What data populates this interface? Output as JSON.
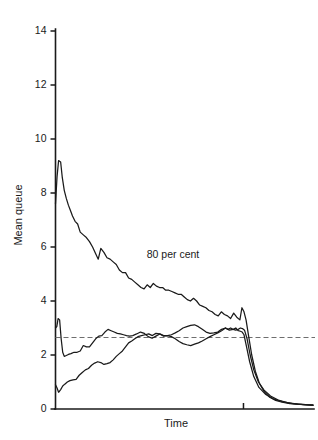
{
  "chart_data": {
    "type": "line",
    "title": "",
    "xlabel": "Time",
    "ylabel": "Mean queue",
    "ylim": [
      0,
      14
    ],
    "yticks": [
      0,
      2,
      4,
      6,
      8,
      10,
      12,
      14
    ],
    "ytick_labels": [
      "0",
      "2",
      "4",
      "6",
      "8",
      "10",
      "12",
      "14"
    ],
    "xlim": [
      0,
      100
    ],
    "xticks": [
      73
    ],
    "xtick_labels": [
      ""
    ],
    "grid": false,
    "legend": "none",
    "annotations": [
      {
        "text": "80 per cent",
        "x": 35,
        "y": 5.7
      }
    ],
    "reference_lines": [
      {
        "orientation": "horizontal",
        "value": 2.65,
        "style": "dashed",
        "color": "#6e6e6e"
      }
    ],
    "series": [
      {
        "name": "80 per cent",
        "color": "#1a1a1a",
        "x": [
          0.0,
          0.6,
          1.2,
          2.0,
          2.6,
          3.4,
          4.2,
          5.0,
          5.8,
          6.6,
          7.6,
          8.6,
          9.6,
          10.8,
          12.0,
          13.2,
          14.4,
          15.6,
          16.6,
          17.6,
          18.8,
          20.0,
          21.2,
          22.4,
          23.6,
          24.8,
          26.0,
          27.2,
          28.4,
          29.6,
          30.8,
          32.0,
          33.2,
          34.4,
          35.6,
          36.8,
          38.0,
          39.2,
          40.4,
          41.6,
          42.8,
          44.0,
          45.2,
          46.4,
          47.6,
          48.8,
          50.0,
          51.2,
          52.4,
          53.6,
          54.8,
          56.0,
          57.2,
          58.4,
          59.6,
          60.8,
          62.0,
          63.2,
          64.4,
          65.6,
          66.8,
          68.0,
          69.2,
          70.4,
          71.6,
          72.4,
          73.2,
          74.0,
          75.0,
          76.2,
          77.6,
          79.2,
          81.0,
          83.0,
          85.5,
          88.0,
          91.0,
          94.0,
          97.0,
          100.0
        ],
        "y": [
          7.6,
          8.6,
          9.2,
          9.15,
          8.6,
          8.1,
          7.8,
          7.55,
          7.35,
          7.15,
          6.95,
          6.85,
          6.55,
          6.45,
          6.35,
          6.2,
          6.0,
          5.75,
          5.55,
          5.95,
          5.8,
          5.6,
          5.55,
          5.45,
          5.35,
          5.15,
          5.05,
          5.05,
          4.85,
          4.8,
          4.7,
          4.6,
          4.5,
          4.45,
          4.6,
          4.5,
          4.65,
          4.55,
          4.5,
          4.5,
          4.4,
          4.4,
          4.35,
          4.3,
          4.25,
          4.25,
          4.15,
          4.05,
          4.0,
          4.1,
          4.0,
          3.85,
          3.8,
          3.75,
          3.65,
          3.6,
          3.5,
          3.45,
          3.6,
          3.5,
          3.45,
          3.35,
          3.55,
          3.4,
          3.3,
          3.75,
          3.6,
          3.3,
          2.7,
          2.0,
          1.4,
          0.95,
          0.65,
          0.45,
          0.32,
          0.25,
          0.2,
          0.18,
          0.16,
          0.15
        ]
      },
      {
        "name": "middle curve",
        "color": "#1a1a1a",
        "x": [
          0.0,
          0.5,
          1.0,
          1.6,
          2.2,
          2.8,
          3.4,
          4.2,
          5.0,
          6.0,
          7.2,
          8.4,
          9.6,
          10.8,
          12.0,
          13.2,
          14.4,
          15.6,
          16.8,
          18.0,
          19.2,
          20.4,
          21.6,
          22.8,
          24.0,
          25.2,
          26.4,
          27.6,
          28.8,
          30.0,
          31.5,
          33.0,
          34.5,
          36.0,
          37.5,
          39.0,
          40.5,
          42.0,
          43.5,
          45.0,
          46.5,
          48.0,
          49.5,
          51.0,
          52.5,
          54.0,
          55.5,
          57.0,
          58.5,
          60.0,
          61.5,
          63.0,
          64.5,
          66.0,
          67.0,
          68.0,
          69.0,
          70.0,
          71.0,
          71.8,
          72.6,
          73.4,
          74.4,
          75.6,
          77.0,
          78.8,
          81.0,
          83.5,
          86.5,
          90.0,
          94.0,
          100.0
        ],
        "y": [
          3.0,
          3.05,
          3.35,
          3.3,
          2.6,
          2.1,
          1.95,
          1.98,
          2.02,
          2.05,
          2.1,
          2.1,
          2.15,
          2.35,
          2.3,
          2.3,
          2.45,
          2.6,
          2.7,
          2.72,
          2.85,
          2.95,
          2.9,
          2.85,
          2.8,
          2.78,
          2.75,
          2.72,
          2.7,
          2.72,
          2.78,
          2.85,
          2.8,
          2.68,
          2.62,
          2.7,
          2.78,
          2.72,
          2.72,
          2.75,
          2.82,
          2.9,
          3.0,
          3.05,
          3.1,
          3.12,
          3.05,
          2.95,
          2.85,
          2.8,
          2.82,
          2.85,
          2.95,
          3.0,
          2.95,
          3.0,
          2.95,
          2.92,
          2.95,
          3.0,
          2.98,
          2.92,
          2.6,
          2.0,
          1.45,
          1.0,
          0.7,
          0.48,
          0.33,
          0.24,
          0.18,
          0.14
        ]
      },
      {
        "name": "lower curve",
        "color": "#1a1a1a",
        "x": [
          0.0,
          0.6,
          1.2,
          2.0,
          2.8,
          3.6,
          4.6,
          5.6,
          6.8,
          8.0,
          9.2,
          10.4,
          11.6,
          12.8,
          14.0,
          15.2,
          16.4,
          17.6,
          18.8,
          20.0,
          21.2,
          22.4,
          23.6,
          24.8,
          26.0,
          27.2,
          28.4,
          29.6,
          30.8,
          32.0,
          33.4,
          34.8,
          36.2,
          37.6,
          39.0,
          40.5,
          42.0,
          43.5,
          45.0,
          46.5,
          48.0,
          49.5,
          51.0,
          52.5,
          54.0,
          55.5,
          57.0,
          58.5,
          60.0,
          61.5,
          63.0,
          64.5,
          66.0,
          67.5,
          69.0,
          70.0,
          71.0,
          71.8,
          72.5,
          73.2,
          74.2,
          75.4,
          77.0,
          79.0,
          81.5,
          84.5,
          88.0,
          92.0,
          96.0,
          100.0
        ],
        "y": [
          0.9,
          0.78,
          0.62,
          0.72,
          0.85,
          0.92,
          1.0,
          1.05,
          1.08,
          1.1,
          1.25,
          1.35,
          1.45,
          1.5,
          1.62,
          1.7,
          1.75,
          1.72,
          1.65,
          1.68,
          1.72,
          1.82,
          1.95,
          2.05,
          2.15,
          2.3,
          2.45,
          2.52,
          2.6,
          2.68,
          2.72,
          2.75,
          2.78,
          2.72,
          2.8,
          2.78,
          2.7,
          2.72,
          2.68,
          2.6,
          2.5,
          2.42,
          2.38,
          2.35,
          2.4,
          2.45,
          2.52,
          2.6,
          2.68,
          2.75,
          2.82,
          2.9,
          3.0,
          2.92,
          2.95,
          3.0,
          2.9,
          2.88,
          2.85,
          2.75,
          2.3,
          1.75,
          1.2,
          0.8,
          0.55,
          0.38,
          0.27,
          0.2,
          0.16,
          0.13
        ]
      }
    ]
  },
  "labels": {
    "y_axis_title": "Mean queue",
    "x_axis_title": "Time",
    "annotation_80": "80 per cent"
  }
}
